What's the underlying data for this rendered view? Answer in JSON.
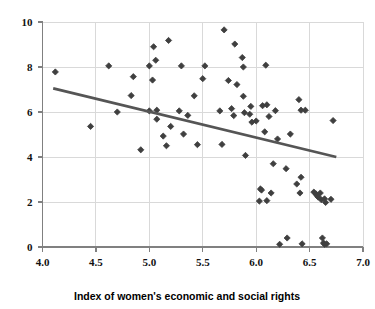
{
  "chart_data": {
    "type": "scatter",
    "title": "",
    "xlabel": "Index of women's economic and social rights",
    "ylabel": "",
    "xlim": [
      4.0,
      7.0
    ],
    "ylim": [
      0,
      10
    ],
    "xticks": [
      "4.0",
      "4.5",
      "5.0",
      "5.5",
      "6.0",
      "6.5",
      "7.0"
    ],
    "xtick_values": [
      4.0,
      4.5,
      5.0,
      5.5,
      6.0,
      6.5,
      7.0
    ],
    "yticks": [
      "0",
      "2",
      "4",
      "6",
      "8",
      "10"
    ],
    "ytick_values": [
      0,
      2,
      4,
      6,
      8,
      10
    ],
    "grid": true,
    "grid_color": "#d9d9d9",
    "axis_color": "#808080",
    "marker": "diamond",
    "marker_color": "#3f3f3f",
    "marker_size": 5,
    "legend": "none",
    "points": [
      [
        4.12,
        7.78
      ],
      [
        4.45,
        5.36
      ],
      [
        4.62,
        8.05
      ],
      [
        4.7,
        6.0
      ],
      [
        4.83,
        6.73
      ],
      [
        4.85,
        7.57
      ],
      [
        4.92,
        4.32
      ],
      [
        5.0,
        8.05
      ],
      [
        5.0,
        6.05
      ],
      [
        5.03,
        7.42
      ],
      [
        5.04,
        8.9
      ],
      [
        5.06,
        8.3
      ],
      [
        5.07,
        6.08
      ],
      [
        5.07,
        5.68
      ],
      [
        5.13,
        4.93
      ],
      [
        5.16,
        4.5
      ],
      [
        5.18,
        9.18
      ],
      [
        5.2,
        5.36
      ],
      [
        5.28,
        6.05
      ],
      [
        5.3,
        8.05
      ],
      [
        5.32,
        5.02
      ],
      [
        5.36,
        5.85
      ],
      [
        5.42,
        6.72
      ],
      [
        5.45,
        4.55
      ],
      [
        5.5,
        7.48
      ],
      [
        5.52,
        8.05
      ],
      [
        5.66,
        6.05
      ],
      [
        5.68,
        4.56
      ],
      [
        5.7,
        9.65
      ],
      [
        5.74,
        7.4
      ],
      [
        5.77,
        6.15
      ],
      [
        5.79,
        5.84
      ],
      [
        5.8,
        9.02
      ],
      [
        5.82,
        7.22
      ],
      [
        5.87,
        8.42
      ],
      [
        5.88,
        8.0
      ],
      [
        5.88,
        6.7
      ],
      [
        5.89,
        5.97
      ],
      [
        5.9,
        4.07
      ],
      [
        5.94,
        5.9
      ],
      [
        5.95,
        6.25
      ],
      [
        5.96,
        5.55
      ],
      [
        6.0,
        5.6
      ],
      [
        6.03,
        2.04
      ],
      [
        6.04,
        2.58
      ],
      [
        6.05,
        2.53
      ],
      [
        6.06,
        6.28
      ],
      [
        6.08,
        5.12
      ],
      [
        6.09,
        8.08
      ],
      [
        6.1,
        6.32
      ],
      [
        6.1,
        2.06
      ],
      [
        6.12,
        5.8
      ],
      [
        6.14,
        2.4
      ],
      [
        6.16,
        3.7
      ],
      [
        6.18,
        6.06
      ],
      [
        6.2,
        4.8
      ],
      [
        6.22,
        0.12
      ],
      [
        6.28,
        3.48
      ],
      [
        6.29,
        0.4
      ],
      [
        6.32,
        5.02
      ],
      [
        6.38,
        2.8
      ],
      [
        6.4,
        6.55
      ],
      [
        6.41,
        2.4
      ],
      [
        6.42,
        6.08
      ],
      [
        6.42,
        3.1
      ],
      [
        6.43,
        0.14
      ],
      [
        6.46,
        6.08
      ],
      [
        6.54,
        2.44
      ],
      [
        6.56,
        2.36
      ],
      [
        6.57,
        2.28
      ],
      [
        6.58,
        2.22
      ],
      [
        6.6,
        2.4
      ],
      [
        6.61,
        2.1
      ],
      [
        6.62,
        0.4
      ],
      [
        6.63,
        0.18
      ],
      [
        6.64,
        2.14
      ],
      [
        6.64,
        0.12
      ],
      [
        6.65,
        1.98
      ],
      [
        6.66,
        0.14
      ],
      [
        6.7,
        2.12
      ],
      [
        6.72,
        5.62
      ]
    ],
    "trendline": {
      "x1": 4.1,
      "y1": 7.05,
      "x2": 6.75,
      "y2": 4.0,
      "color": "#555555",
      "width": 2.6
    }
  }
}
